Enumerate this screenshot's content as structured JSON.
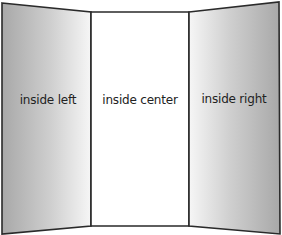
{
  "diagram": {
    "type": "tri-fold brochure inside layout",
    "panels": [
      {
        "id": "left",
        "label": "inside left"
      },
      {
        "id": "center",
        "label": "inside center"
      },
      {
        "id": "right",
        "label": "inside right"
      }
    ],
    "colors": {
      "stroke": "#2a2a2a",
      "side_panel_dark": "#a8a8a8",
      "side_panel_light": "#f4f4f4",
      "center_panel": "#ffffff",
      "label": "#222222"
    }
  }
}
